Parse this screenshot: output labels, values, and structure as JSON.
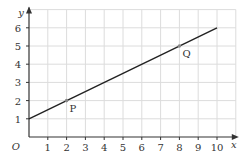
{
  "chart_data": {
    "type": "line",
    "title": "",
    "xlabel": "x",
    "ylabel": "y",
    "origin_label": "O",
    "xlim": [
      0,
      11
    ],
    "ylim": [
      0,
      7
    ],
    "grid": true,
    "x_ticks": [
      1,
      2,
      3,
      4,
      5,
      6,
      7,
      8,
      9,
      10
    ],
    "y_ticks": [
      1,
      2,
      3,
      4,
      5,
      6
    ],
    "series": [
      {
        "name": "line",
        "x": [
          0,
          10
        ],
        "y": [
          1,
          6
        ],
        "color": "#222222"
      }
    ],
    "points": [
      {
        "label": "P",
        "x": 2,
        "y": 2
      },
      {
        "label": "Q",
        "x": 8,
        "y": 5
      }
    ],
    "colors": {
      "grid": "#dcdcdc",
      "axis": "#333333",
      "line": "#222222",
      "point": "#888888"
    }
  }
}
